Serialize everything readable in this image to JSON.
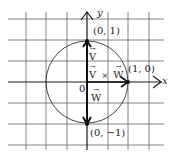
{
  "figure": {
    "axes": {
      "x_label": "x",
      "y_label": "y",
      "origin_label": "0"
    },
    "points": [
      {
        "label": "(0, 1)",
        "x": 0,
        "y": 1
      },
      {
        "label": "(1, 0)",
        "x": 1,
        "y": 0
      },
      {
        "label": "(0, −1)",
        "x": 0,
        "y": -1
      }
    ],
    "vectors": [
      {
        "name": "V",
        "label": "V",
        "from": [
          0,
          0
        ],
        "to": [
          0,
          1
        ]
      },
      {
        "name": "W",
        "label": "W",
        "from": [
          0,
          0
        ],
        "to": [
          0,
          -1
        ]
      },
      {
        "name": "VxW",
        "label_left": "V",
        "operator": "×",
        "label_right": "W",
        "from": [
          0,
          0
        ],
        "to": [
          1,
          0
        ]
      }
    ],
    "circle": {
      "center": [
        0,
        0
      ],
      "radius": 1
    },
    "grid": {
      "cell_units": 0.5
    },
    "colors": {
      "ink": "#1a1a1a",
      "grid": "#555555",
      "background": "#ffffff"
    }
  }
}
